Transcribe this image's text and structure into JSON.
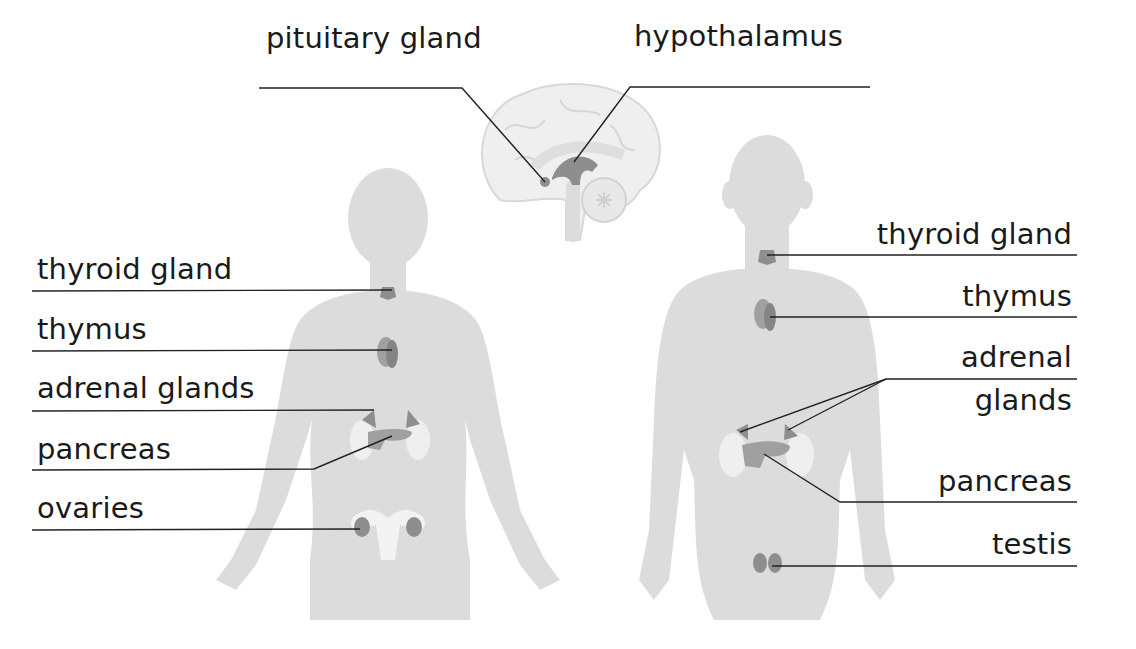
{
  "colors": {
    "body": "#dcdcdc",
    "organ": "#8e8e8e",
    "organ_light": "#a8a8a8",
    "kidney": "#efefef",
    "brain": "#eeeeee",
    "line": "#222222"
  },
  "brain": {
    "labels": [
      {
        "id": "pituitary",
        "text": "pituitary gland"
      },
      {
        "id": "hypothalamus",
        "text": "hypothalamus"
      }
    ]
  },
  "female": {
    "labels": [
      {
        "id": "thyroid",
        "text": "thyroid gland"
      },
      {
        "id": "thymus",
        "text": "thymus"
      },
      {
        "id": "adrenal",
        "text": "adrenal glands"
      },
      {
        "id": "pancreas",
        "text": "pancreas"
      },
      {
        "id": "ovaries",
        "text": "ovaries"
      }
    ]
  },
  "male": {
    "labels": [
      {
        "id": "thyroid",
        "text": "thyroid gland"
      },
      {
        "id": "thymus",
        "text": "thymus"
      },
      {
        "id": "adrenal_1",
        "text": "adrenal"
      },
      {
        "id": "adrenal_2",
        "text": "glands"
      },
      {
        "id": "pancreas",
        "text": "pancreas"
      },
      {
        "id": "testis",
        "text": "testis"
      }
    ]
  }
}
